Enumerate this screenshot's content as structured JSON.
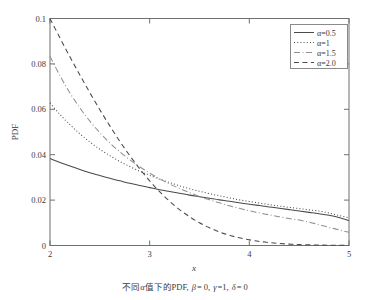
{
  "chart_data": {
    "type": "line",
    "title": "",
    "caption": "不同α值下的PDF, β= 0, γ =1, δ = 0",
    "xlabel": "x",
    "ylabel": "PDF",
    "xlim": [
      2,
      5
    ],
    "ylim": [
      0,
      0.1
    ],
    "xticks": [
      "2",
      "3",
      "4",
      "5"
    ],
    "xtick_values": [
      2,
      3,
      4,
      5
    ],
    "yticks": [
      "0",
      "0.02",
      "0.04",
      "0.06",
      "0.08",
      "0.1"
    ],
    "ytick_values": [
      0,
      0.02,
      0.04,
      0.06,
      0.08,
      0.1
    ],
    "grid": false,
    "legend_position": "top-right",
    "x": [
      2.0,
      2.1,
      2.2,
      2.3,
      2.4,
      2.5,
      2.6,
      2.7,
      2.8,
      2.9,
      3.0,
      3.1,
      3.2,
      3.3,
      3.4,
      3.5,
      3.6,
      3.7,
      3.8,
      3.9,
      4.0,
      4.1,
      4.2,
      4.3,
      4.4,
      4.5,
      4.6,
      4.7,
      4.8,
      4.9,
      5.0
    ],
    "series": [
      {
        "name": "α=0.5",
        "style": "solid",
        "color": "#4a4a4a",
        "values": [
          0.0383,
          0.0366,
          0.035,
          0.0335,
          0.0321,
          0.0308,
          0.0296,
          0.0285,
          0.0274,
          0.0264,
          0.0255,
          0.0246,
          0.0238,
          0.023,
          0.0222,
          0.0215,
          0.0208,
          0.0201,
          0.0195,
          0.0188,
          0.0182,
          0.0176,
          0.017,
          0.0164,
          0.0158,
          0.0152,
          0.0146,
          0.014,
          0.0133,
          0.0123,
          0.011
        ]
      },
      {
        "name": "α=1",
        "style": "dotted",
        "color": "#4a4a4a",
        "values": [
          0.0628,
          0.0577,
          0.0532,
          0.0492,
          0.0456,
          0.0424,
          0.0396,
          0.037,
          0.0348,
          0.0327,
          0.0309,
          0.0292,
          0.0277,
          0.0263,
          0.025,
          0.0239,
          0.0228,
          0.0219,
          0.021,
          0.0201,
          0.0194,
          0.0187,
          0.018,
          0.0174,
          0.0168,
          0.0163,
          0.0157,
          0.0152,
          0.0143,
          0.0132,
          0.0122
        ]
      },
      {
        "name": "α=1.5",
        "style": "dashdot",
        "color": "#8f8f8f",
        "values": [
          0.0833,
          0.0748,
          0.0672,
          0.0606,
          0.0548,
          0.0497,
          0.0452,
          0.0413,
          0.0378,
          0.0347,
          0.0319,
          0.0294,
          0.0271,
          0.0251,
          0.0233,
          0.0216,
          0.0201,
          0.0188,
          0.0175,
          0.0164,
          0.0153,
          0.0144,
          0.0135,
          0.0127,
          0.0119,
          0.0112,
          0.0103,
          0.0092,
          0.008,
          0.0069,
          0.0058
        ]
      },
      {
        "name": "α=2.0",
        "style": "dashed",
        "color": "#4a4a4a",
        "values": [
          0.1,
          0.0914,
          0.0831,
          0.0751,
          0.0673,
          0.0598,
          0.0527,
          0.0459,
          0.0396,
          0.0338,
          0.0285,
          0.0237,
          0.0195,
          0.0158,
          0.0127,
          0.01,
          0.0078,
          0.006,
          0.0045,
          0.0034,
          0.0025,
          0.0018,
          0.0013,
          0.0009,
          0.0006,
          0.0004,
          0.0003,
          0.0002,
          0.0001,
          0.0001,
          0.0
        ]
      }
    ]
  },
  "legend": {
    "entries": [
      {
        "label": "α=0.5"
      },
      {
        "label": "α=1"
      },
      {
        "label": "α=1.5"
      },
      {
        "label": "α=2.0"
      }
    ]
  },
  "axes": {
    "ylabel": "PDF",
    "xlabel": "x",
    "xticks": [
      "2",
      "3",
      "4",
      "5"
    ],
    "yticks": [
      "0",
      "0.02",
      "0.04",
      "0.06",
      "0.08",
      "0.1"
    ]
  },
  "caption": {
    "full": "不同α值下的PDF, β= 0, γ =1, δ = 0",
    "part_cn": "不同",
    "part_alpha": "α",
    "part_cn2": "值下的PDF,",
    "part_beta": "β",
    "part_beta_val": "= 0,",
    "part_gamma": "γ",
    "part_gamma_val": "=1,",
    "part_delta": "δ",
    "part_delta_val": "= 0"
  },
  "colors": {
    "frame": "#6f6f6f",
    "curve_dark": "#4a4a4a",
    "curve_light": "#8f8f8f",
    "text": "#3a3a3a",
    "background": "#ffffff"
  }
}
